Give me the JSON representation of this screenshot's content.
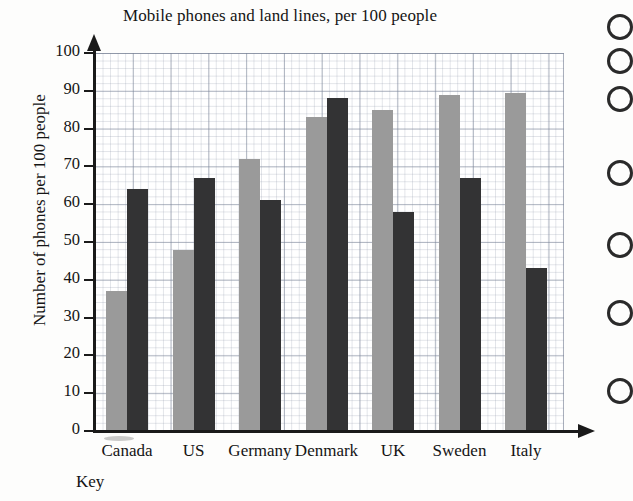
{
  "chart_data": {
    "type": "bar",
    "title": "Mobile phones and land lines, per 100 people",
    "xlabel": "",
    "ylabel": "Number of phones per 100 people",
    "ylim": [
      0,
      100
    ],
    "ytick_labels": [
      "100",
      "90",
      "80",
      "70",
      "60",
      "50",
      "40",
      "30",
      "20",
      "10",
      "0"
    ],
    "ytick_values": [
      100,
      90,
      80,
      70,
      60,
      50,
      40,
      30,
      20,
      10,
      0
    ],
    "grid": true,
    "legend_position": "below",
    "categories": [
      "Canada",
      "US",
      "Germany",
      "Denmark",
      "UK",
      "Sweden",
      "Italy"
    ],
    "series": [
      {
        "name": "Mobile phones",
        "color": "#9a9a9a",
        "values": [
          37,
          48,
          72,
          83,
          85,
          89,
          89.5
        ]
      },
      {
        "name": "Land lines",
        "color": "#333334",
        "values": [
          64,
          67,
          61,
          88,
          58,
          67,
          43
        ]
      }
    ]
  },
  "key": {
    "label": "Key"
  },
  "page_marks": {
    "punch_count": 7
  }
}
